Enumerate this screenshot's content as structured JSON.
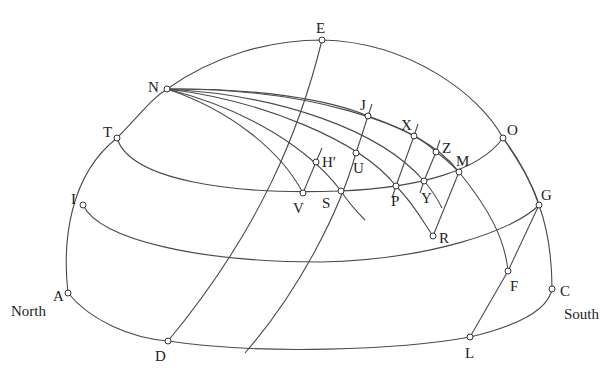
{
  "diagram": {
    "type": "celestial-sphere-construction",
    "direction_labels": {
      "north": "North",
      "south": "South"
    },
    "points": [
      {
        "id": "N",
        "label": "N"
      },
      {
        "id": "E",
        "label": "E"
      },
      {
        "id": "T",
        "label": "T"
      },
      {
        "id": "O",
        "label": "O"
      },
      {
        "id": "I",
        "label": "I"
      },
      {
        "id": "G",
        "label": "G"
      },
      {
        "id": "A",
        "label": "A"
      },
      {
        "id": "C",
        "label": "C"
      },
      {
        "id": "D",
        "label": "D"
      },
      {
        "id": "L",
        "label": "L"
      },
      {
        "id": "F",
        "label": "F"
      },
      {
        "id": "J",
        "label": "J"
      },
      {
        "id": "X",
        "label": "X"
      },
      {
        "id": "Z",
        "label": "Z"
      },
      {
        "id": "M",
        "label": "M"
      },
      {
        "id": "U",
        "label": "U"
      },
      {
        "id": "H",
        "label": "H′"
      },
      {
        "id": "V",
        "label": "V"
      },
      {
        "id": "S",
        "label": "S"
      },
      {
        "id": "P",
        "label": "P"
      },
      {
        "id": "Y",
        "label": "Y"
      },
      {
        "id": "R",
        "label": "R"
      }
    ],
    "line_color": "#4a4a4a",
    "point_fill": "#ffffff"
  }
}
